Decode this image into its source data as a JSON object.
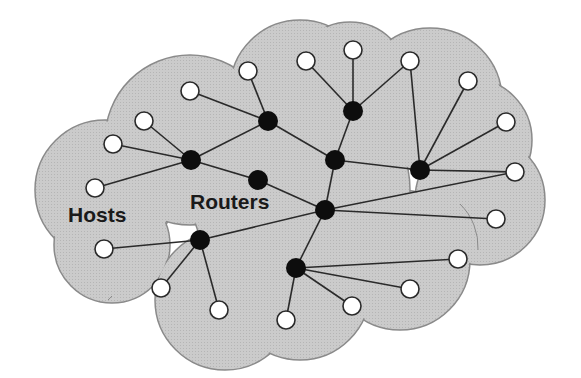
{
  "diagram": {
    "labels": {
      "hosts": "Hosts",
      "routers": "Routers"
    },
    "colors": {
      "cloud_fill": "#c9c9c9",
      "cloud_stroke": "#8a8a8a",
      "edge": "#2a2a2a",
      "router": "#0d0d0d",
      "host_fill": "#ffffff",
      "host_stroke": "#2a2a2a",
      "background": "#ffffff"
    },
    "routers": [
      {
        "id": "R1",
        "x": 191,
        "y": 160
      },
      {
        "id": "R2",
        "x": 268,
        "y": 121
      },
      {
        "id": "R3",
        "x": 258,
        "y": 180
      },
      {
        "id": "R4",
        "x": 353,
        "y": 111
      },
      {
        "id": "R5",
        "x": 335,
        "y": 160
      },
      {
        "id": "R6",
        "x": 420,
        "y": 170
      },
      {
        "id": "R7",
        "x": 325,
        "y": 210
      },
      {
        "id": "R8",
        "x": 200,
        "y": 240
      },
      {
        "id": "R9",
        "x": 296,
        "y": 268
      }
    ],
    "hosts": [
      {
        "id": "H1",
        "x": 95,
        "y": 188
      },
      {
        "id": "H2",
        "x": 113,
        "y": 144
      },
      {
        "id": "H3",
        "x": 144,
        "y": 121
      },
      {
        "id": "H4",
        "x": 190,
        "y": 91
      },
      {
        "id": "H5",
        "x": 248,
        "y": 71
      },
      {
        "id": "H6",
        "x": 306,
        "y": 61
      },
      {
        "id": "H7",
        "x": 353,
        "y": 50
      },
      {
        "id": "H8",
        "x": 410,
        "y": 61
      },
      {
        "id": "H9",
        "x": 468,
        "y": 81
      },
      {
        "id": "H10",
        "x": 506,
        "y": 122
      },
      {
        "id": "H11",
        "x": 515,
        "y": 172
      },
      {
        "id": "H12",
        "x": 496,
        "y": 219
      },
      {
        "id": "H13",
        "x": 458,
        "y": 259
      },
      {
        "id": "H14",
        "x": 410,
        "y": 289
      },
      {
        "id": "H15",
        "x": 352,
        "y": 306
      },
      {
        "id": "H16",
        "x": 286,
        "y": 320
      },
      {
        "id": "H17",
        "x": 219,
        "y": 310
      },
      {
        "id": "H18",
        "x": 161,
        "y": 288
      },
      {
        "id": "H19",
        "x": 104,
        "y": 249
      }
    ],
    "edges": [
      [
        "R1",
        "H1"
      ],
      [
        "R1",
        "H2"
      ],
      [
        "R1",
        "H3"
      ],
      [
        "R1",
        "R2"
      ],
      [
        "R1",
        "R3"
      ],
      [
        "R2",
        "H4"
      ],
      [
        "R2",
        "H5"
      ],
      [
        "R2",
        "R5"
      ],
      [
        "R3",
        "R7"
      ],
      [
        "R4",
        "H6"
      ],
      [
        "R4",
        "H7"
      ],
      [
        "R4",
        "H8"
      ],
      [
        "R4",
        "R5"
      ],
      [
        "R5",
        "R6"
      ],
      [
        "R5",
        "R7"
      ],
      [
        "R6",
        "H8"
      ],
      [
        "R6",
        "H9"
      ],
      [
        "R6",
        "H10"
      ],
      [
        "R6",
        "H11"
      ],
      [
        "R7",
        "H11"
      ],
      [
        "R7",
        "H12"
      ],
      [
        "R7",
        "R8"
      ],
      [
        "R7",
        "R9"
      ],
      [
        "R8",
        "H19"
      ],
      [
        "R8",
        "H18"
      ],
      [
        "R8",
        "H17"
      ],
      [
        "R9",
        "H13"
      ],
      [
        "R9",
        "H14"
      ],
      [
        "R9",
        "H15"
      ],
      [
        "R9",
        "H16"
      ]
    ]
  }
}
